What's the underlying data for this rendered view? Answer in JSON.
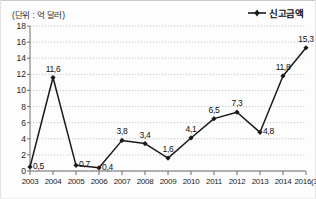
{
  "unit_label": "(단위 : 억 달러)",
  "legend": {
    "label": "신고금액",
    "marker_icon": "line-marker-icon",
    "color": "#1a1a1a"
  },
  "axes": {
    "y_ticks": [
      "0",
      "2",
      "4",
      "6",
      "8",
      "10",
      "12",
      "14",
      "16",
      "18"
    ],
    "x_ticks": [
      "2003",
      "2004",
      "2005",
      "2006",
      "2007",
      "2008",
      "2009",
      "2010",
      "2011",
      "2012",
      "2013",
      "2014",
      "2016(3"
    ]
  },
  "colors": {
    "line": "#1a1a1a",
    "grid": "#b5b5b5",
    "axis": "#6e6e6e",
    "text": "#111111",
    "background": "#fdfdfd"
  },
  "point_labels": [
    "0,5",
    "11,6",
    "0,7",
    "0,4",
    "3,8",
    "3,4",
    "1,6",
    "4,1",
    "6,5",
    "7,3",
    "4,8",
    "11,8",
    "15,3"
  ],
  "chart_data": {
    "type": "line",
    "title": "",
    "subtitle": "",
    "xlabel": "",
    "ylabel": "",
    "unit": "억 달러",
    "categories": [
      "2003",
      "2004",
      "2005",
      "2006",
      "2007",
      "2008",
      "2009",
      "2010",
      "2011",
      "2012",
      "2013",
      "2014",
      "2016(3"
    ],
    "series": [
      {
        "name": "신고금액",
        "values": [
          0.5,
          11.6,
          0.7,
          0.4,
          3.8,
          3.4,
          1.6,
          4.1,
          6.5,
          7.3,
          4.8,
          11.8,
          15.3
        ]
      }
    ],
    "ylim": [
      0,
      18
    ],
    "y_tick_step": 2,
    "grid": "horizontal-dotted",
    "legend_position": "top-right",
    "marker": "filled-diamond"
  }
}
